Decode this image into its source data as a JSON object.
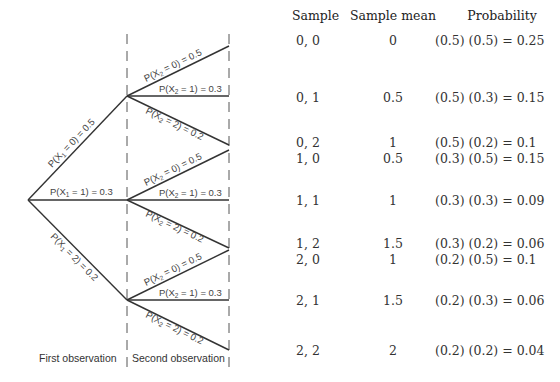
{
  "table": {
    "headers": [
      "Sample",
      "Sample mean",
      "Probability"
    ],
    "rows": [
      {
        "sample": "0, 0",
        "mean": "0",
        "prob": "(0.5) (0.5) = 0.25",
        "y": 40
      },
      {
        "sample": "0, 1",
        "mean": "0.5",
        "prob": "(0.5) (0.3) = 0.15",
        "y": 90
      },
      {
        "sample": "0, 2",
        "mean": "1",
        "prob": "(0.5) (0.2) = 0.1",
        "y": 137
      },
      {
        "sample": "1, 0",
        "mean": "0.5",
        "prob": "(0.3) (0.5) = 0.15",
        "y": 152
      },
      {
        "sample": "1, 1",
        "mean": "1",
        "prob": "(0.3) (0.3) = 0.09",
        "y": 196
      },
      {
        "sample": "1, 2",
        "mean": "1.5",
        "prob": "(0.3) (0.2) = 0.06",
        "y": 237
      },
      {
        "sample": "2, 0",
        "mean": "1",
        "prob": "(0.2) (0.5) = 0.1",
        "y": 254
      },
      {
        "sample": "2, 1",
        "mean": "1.5",
        "prob": "(0.2) (0.3) = 0.06",
        "y": 296
      },
      {
        "sample": "2, 2",
        "mean": "2",
        "prob": "(0.2) (0.2) = 0.04",
        "y": 346
      }
    ]
  },
  "tree": {
    "first_branches": [
      {
        "label": "P(X1 = 0) = 0.5",
        "value": 0,
        "prob": 0.5
      },
      {
        "label": "P(X1 = 1) = 0.3",
        "value": 1,
        "prob": 0.3
      },
      {
        "label": "P(X1 = 2) = 0.2",
        "value": 2,
        "prob": 0.2
      }
    ],
    "second_branches": [
      {
        "label": "P(X2 = 0) = 0.5",
        "value": 0,
        "prob": 0.5
      },
      {
        "label": "P(X2 = 1) = 0.3",
        "value": 1,
        "prob": 0.3
      },
      {
        "label": "P(X2 = 2) = 0.2",
        "value": 2,
        "prob": 0.2
      }
    ],
    "stage_labels": {
      "first": "First observation",
      "second": "Second observation"
    }
  },
  "labels": {
    "p": "P(X",
    "sub1": "1",
    "sub2": "2",
    "eq0": " = 0) = 0.5",
    "eq1": " = 1) = 0.3",
    "eq2": " = 2) = 0.2"
  }
}
